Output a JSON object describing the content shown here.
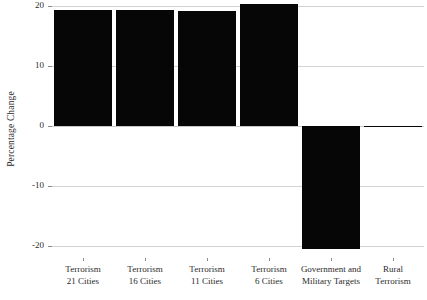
{
  "chart_data": {
    "type": "bar",
    "title": "",
    "xlabel": "",
    "ylabel": "Percentage Change",
    "ylim": [
      -22,
      21
    ],
    "yticks": [
      20,
      10,
      0,
      -10,
      -20
    ],
    "ytick_labels": [
      "20",
      "10",
      "0",
      "-10",
      "-20"
    ],
    "grid": true,
    "legend": "none",
    "bar_color": "#060606",
    "grid_color": "#d2d2d2",
    "categories": [
      "Terrorism 21 Cities",
      "Terrorism 16 Cities",
      "Terrorism 11 Cities",
      "Terrorism 6 Cities",
      "Government and Military Targets",
      "Rural Terrorism"
    ],
    "category_lines": [
      [
        "Terrorism",
        "21 Cities"
      ],
      [
        "Terrorism",
        "16 Cities"
      ],
      [
        "Terrorism",
        "11 Cities"
      ],
      [
        "Terrorism",
        "6 Cities"
      ],
      [
        "Government and",
        "Military Targets"
      ],
      [
        "Rural",
        "Terrorism"
      ]
    ],
    "values": [
      19.3,
      19.3,
      19.2,
      20.3,
      -20.5,
      0.0
    ]
  }
}
